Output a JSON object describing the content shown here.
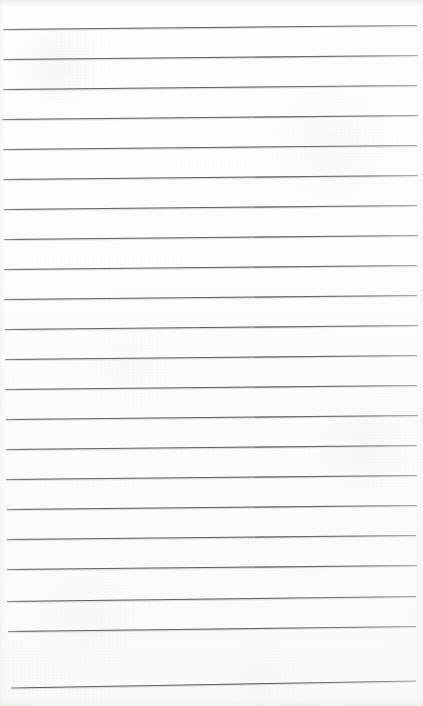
{
  "page": {
    "kind": "scanned-lined-notepad-page",
    "width": 423,
    "height": 706,
    "written_text": "",
    "background_color": "#fdfdfc",
    "paper_tint_color": "#fcfbf9",
    "rule_color": "#6a6a6a",
    "rule_color_light": "#9a9a9a",
    "rule_thickness": 1.1,
    "rule_count": 22,
    "rule_spacing": 30,
    "first_rule_y": 28,
    "slant_rise": 4
  },
  "rules": [
    {
      "label": "rule-1",
      "y_left": 29.5,
      "y_right": 25.5,
      "x_start": 3,
      "x_end": 417
    },
    {
      "label": "rule-2",
      "y_left": 59.5,
      "y_right": 55.5,
      "x_start": 3,
      "x_end": 418
    },
    {
      "label": "rule-3",
      "y_left": 89.5,
      "y_right": 85.5,
      "x_start": 3,
      "x_end": 417
    },
    {
      "label": "rule-4",
      "y_left": 119.5,
      "y_right": 115.5,
      "x_start": 2,
      "x_end": 418
    },
    {
      "label": "rule-5",
      "y_left": 149.5,
      "y_right": 145.5,
      "x_start": 3,
      "x_end": 417
    },
    {
      "label": "rule-6",
      "y_left": 179.5,
      "y_right": 175.5,
      "x_start": 3,
      "x_end": 418
    },
    {
      "label": "rule-7",
      "y_left": 209.5,
      "y_right": 205.5,
      "x_start": 4,
      "x_end": 417
    },
    {
      "label": "rule-8",
      "y_left": 239.5,
      "y_right": 235.5,
      "x_start": 4,
      "x_end": 418
    },
    {
      "label": "rule-9",
      "y_left": 269.5,
      "y_right": 265.5,
      "x_start": 4,
      "x_end": 417
    },
    {
      "label": "rule-10",
      "y_left": 299.5,
      "y_right": 295.5,
      "x_start": 4,
      "x_end": 417
    },
    {
      "label": "rule-11",
      "y_left": 329.5,
      "y_right": 325.5,
      "x_start": 5,
      "x_end": 418
    },
    {
      "label": "rule-12",
      "y_left": 359.5,
      "y_right": 355.5,
      "x_start": 5,
      "x_end": 417
    },
    {
      "label": "rule-13",
      "y_left": 389.5,
      "y_right": 385.5,
      "x_start": 5,
      "x_end": 417
    },
    {
      "label": "rule-14",
      "y_left": 419.5,
      "y_right": 415.5,
      "x_start": 6,
      "x_end": 418
    },
    {
      "label": "rule-15",
      "y_left": 449.5,
      "y_right": 445.5,
      "x_start": 6,
      "x_end": 417
    },
    {
      "label": "rule-16",
      "y_left": 479.5,
      "y_right": 475.5,
      "x_start": 6,
      "x_end": 417
    },
    {
      "label": "rule-17",
      "y_left": 509.5,
      "y_right": 505.5,
      "x_start": 7,
      "x_end": 417
    },
    {
      "label": "rule-18",
      "y_left": 539.5,
      "y_right": 535.5,
      "x_start": 7,
      "x_end": 416
    },
    {
      "label": "rule-19",
      "y_left": 569.5,
      "y_right": 565.5,
      "x_start": 7,
      "x_end": 417
    },
    {
      "label": "rule-20",
      "y_left": 601.5,
      "y_right": 596.5,
      "x_start": 7,
      "x_end": 416
    },
    {
      "label": "rule-21",
      "y_left": 631.5,
      "y_right": 626.5,
      "x_start": 8,
      "x_end": 416
    },
    {
      "label": "rule-22",
      "y_left": 688.0,
      "y_right": 681.0,
      "x_start": 11,
      "x_end": 416
    }
  ]
}
